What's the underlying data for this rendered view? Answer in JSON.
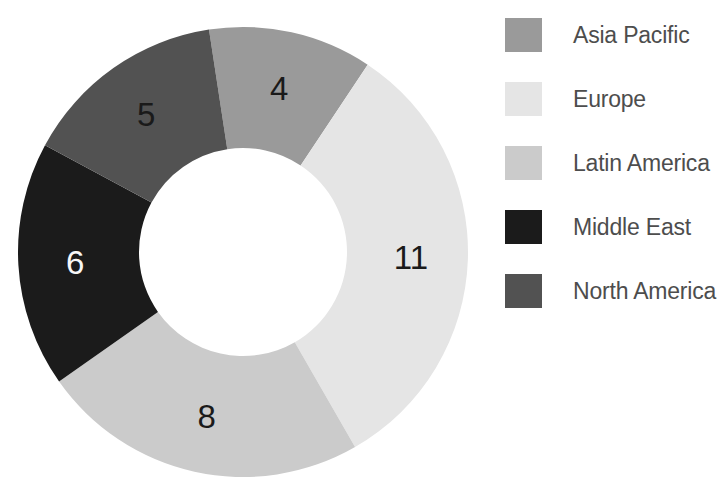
{
  "chart_data": {
    "type": "pie",
    "subtype": "donut",
    "title": "",
    "categories": [
      "Asia Pacific",
      "Europe",
      "Latin America",
      "Middle East",
      "North America"
    ],
    "values": [
      4,
      11,
      8,
      6,
      5
    ],
    "total": 34,
    "data_labels": [
      "4",
      "11",
      "8",
      "6",
      "5"
    ],
    "slice_colors": [
      "#9a9a9a",
      "#e5e5e5",
      "#cbcbcb",
      "#1b1b1b",
      "#525252"
    ],
    "data_label_colors": [
      "#1a1a1a",
      "#1a1a1a",
      "#1a1a1a",
      "#f7f7f7",
      "#1a1a1a"
    ],
    "start_angle_deg": -8.7,
    "direction": "clockwise",
    "inner_radius_ratio": 0.46,
    "grid": false,
    "legend_position": "right",
    "legend": {
      "text_color": "#4d4d4d",
      "items": [
        {
          "label": "Asia Pacific",
          "color": "#9a9a9a"
        },
        {
          "label": "Europe",
          "color": "#e5e5e5"
        },
        {
          "label": "Latin America",
          "color": "#cbcbcb"
        },
        {
          "label": "Middle East",
          "color": "#1b1b1b"
        },
        {
          "label": "North America",
          "color": "#525252"
        }
      ]
    }
  }
}
